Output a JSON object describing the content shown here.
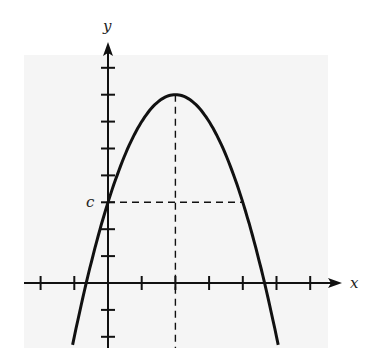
{
  "chart_data": {
    "type": "line",
    "title": "",
    "xlabel": "x",
    "ylabel": "y",
    "function": "y = 7 - (x - 2)^2",
    "vertex": {
      "x": 2,
      "y": 7
    },
    "y_intercept": {
      "x": 0,
      "y": 3,
      "label": "c"
    },
    "symmetric_point": {
      "x": 4,
      "y": 3
    },
    "roots": [
      -0.65,
      4.65
    ],
    "x_ticks": [
      -2,
      -1,
      1,
      2,
      3,
      4,
      5,
      6
    ],
    "y_ticks": [
      -2,
      -1,
      1,
      2,
      3,
      4,
      5,
      6,
      7,
      8
    ],
    "xlim": [
      -2.5,
      7
    ],
    "ylim": [
      -2.4,
      8.9
    ],
    "tick_labels_shown": false,
    "annotations": [
      {
        "type": "dashed-vertical",
        "x": 2,
        "from_y": -2.4,
        "to_y": 7,
        "desc": "axis of symmetry through vertex"
      },
      {
        "type": "dashed-horizontal",
        "y": 3,
        "from_x": 0,
        "to_x": 4,
        "desc": "from y-intercept c to symmetric point"
      }
    ],
    "series": [
      {
        "name": "parabola",
        "x": [
          -1.05,
          -0.65,
          0,
          1,
          2,
          3,
          4,
          4.65,
          5.05
        ],
        "y": [
          -2.3,
          0,
          3,
          6,
          7,
          6,
          3,
          0,
          -2.3
        ]
      }
    ],
    "grid": false,
    "legend": null
  },
  "labels": {
    "x_axis": "x",
    "y_axis": "y",
    "c_label": "c"
  },
  "colors": {
    "background": "#f5f5f5",
    "ink": "#111111"
  }
}
